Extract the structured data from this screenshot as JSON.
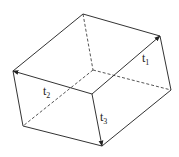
{
  "diagram": {
    "type": "parallelepiped",
    "vertices": {
      "A": [
        83,
        14
      ],
      "B": [
        160,
        36
      ],
      "C": [
        13,
        71
      ],
      "D": [
        92,
        94
      ],
      "E": [
        171,
        90
      ],
      "F": [
        93,
        70
      ],
      "G": [
        23,
        126
      ],
      "H": [
        102,
        146
      ]
    },
    "visible_edges": [
      [
        "A",
        "B"
      ],
      [
        "A",
        "C"
      ],
      [
        "C",
        "D"
      ],
      [
        "D",
        "B"
      ],
      [
        "B",
        "E"
      ],
      [
        "E",
        "H"
      ],
      [
        "H",
        "D"
      ],
      [
        "H",
        "G"
      ],
      [
        "G",
        "C"
      ]
    ],
    "hidden_edges": [
      [
        "A",
        "F"
      ],
      [
        "F",
        "E"
      ],
      [
        "F",
        "G"
      ]
    ],
    "vectors": [
      {
        "name": "t1",
        "from": "D",
        "to": "B"
      },
      {
        "name": "t2",
        "from": "D",
        "to": "C"
      },
      {
        "name": "t3",
        "from": "D",
        "to": "H"
      }
    ],
    "labels": {
      "t1": {
        "base": "t",
        "sub": "1",
        "x": 142,
        "y": 62
      },
      "t2": {
        "base": "t",
        "sub": "2",
        "x": 43,
        "y": 95
      },
      "t3": {
        "base": "t",
        "sub": "3",
        "x": 100,
        "y": 121
      }
    }
  }
}
